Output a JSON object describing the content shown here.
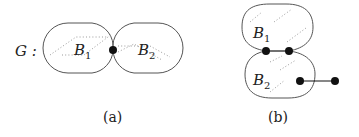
{
  "panel_a": {
    "graph_label": "G :",
    "blocks": [
      {
        "label": "B",
        "subscript": "1"
      },
      {
        "label": "B",
        "subscript": "2"
      }
    ],
    "caption": "(a)"
  },
  "panel_b": {
    "blocks": [
      {
        "label": "B",
        "subscript": "1"
      },
      {
        "label": "B",
        "subscript": "2"
      }
    ],
    "caption": "(b)"
  }
}
